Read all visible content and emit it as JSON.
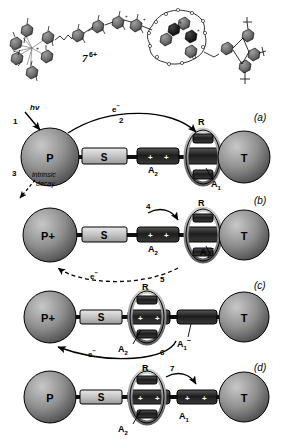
{
  "figure": {
    "structure_label": "7",
    "structure_charge": "6+"
  },
  "components": {
    "photosensitizer": "P",
    "photosensitizer_oxidized": "P+",
    "spacer": "S",
    "acceptor2": "A",
    "acceptor2_sub": "2",
    "ring": "R",
    "acceptor1": "A",
    "acceptor1_sub": "1",
    "acceptor1_charge": "−",
    "stopper": "T",
    "plus": "+"
  },
  "panels": [
    {
      "letter": "(a)",
      "left_sphere": "P",
      "right_sphere": "T",
      "spacer": "S",
      "a2": "A",
      "a2_sub": "2",
      "ring": "R",
      "a1": "A",
      "a1_sub": "1",
      "a1_sup": "",
      "ring_on": "A1",
      "steps": [
        {
          "id": "1",
          "label": "hν"
        },
        {
          "id": "2",
          "label": "e−"
        },
        {
          "id": "3",
          "label": "intrinsic decay"
        }
      ]
    },
    {
      "letter": "(b)",
      "left_sphere": "P+",
      "right_sphere": "T",
      "spacer": "S",
      "a2": "A",
      "a2_sub": "2",
      "ring": "R",
      "a1": "A",
      "a1_sub": "1",
      "a1_sup": "−",
      "ring_on": "A1",
      "steps": [
        {
          "id": "4",
          "label": ""
        },
        {
          "id": "5",
          "label": "e−"
        }
      ]
    },
    {
      "letter": "(c)",
      "left_sphere": "P+",
      "right_sphere": "T",
      "spacer": "S",
      "a2": "A",
      "a2_sub": "2",
      "ring": "R",
      "a1": "A",
      "a1_sub": "1",
      "a1_sup": "−",
      "ring_on": "A2",
      "steps": [
        {
          "id": "6",
          "label": "e−"
        }
      ]
    },
    {
      "letter": "(d)",
      "left_sphere": "P",
      "right_sphere": "T",
      "spacer": "S",
      "a2": "A",
      "a2_sub": "2",
      "ring": "R",
      "a1": "A",
      "a1_sub": "1",
      "a1_sup": "",
      "ring_on": "A2",
      "steps": [
        {
          "id": "7",
          "label": ""
        }
      ]
    }
  ],
  "text": {
    "hv": "hν",
    "electron": "e",
    "electron_sup": "−",
    "intrinsic": "intrinsic",
    "decay": "decay",
    "n1": "1",
    "n2": "2",
    "n3": "3",
    "n4": "4",
    "n5": "5",
    "n6": "6",
    "n7": "7",
    "panel_a": "(a)",
    "panel_b": "(b)",
    "panel_c": "(c)",
    "panel_d": "(d)"
  },
  "colors": {
    "sphere": "#8a8a8a",
    "sphere_dark": "#5a5a5a",
    "spacer_light": "#c9c9c9",
    "acceptor_dark": "#2b2b2b",
    "ring_gray": "#9a9a9a",
    "line": "#000000"
  }
}
